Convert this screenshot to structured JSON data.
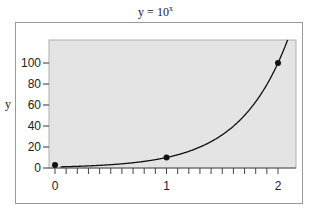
{
  "chart_data": {
    "type": "line",
    "title_base": "y = 10",
    "title_exp": "x",
    "xlabel": "",
    "ylabel": "y",
    "xlim": [
      0,
      2
    ],
    "ylim": [
      0,
      120
    ],
    "x_ticks": [
      0,
      1,
      2
    ],
    "x_tick_labels": [
      "0",
      "1",
      "2"
    ],
    "x_minor_tick_step": 0.1,
    "y_ticks": [
      0,
      20,
      40,
      60,
      80,
      100
    ],
    "y_tick_labels": [
      "0",
      "20",
      "40",
      "60",
      "80",
      "100"
    ],
    "grid": false,
    "plot_background": "#e4e4e4",
    "line_color": "#111111",
    "series": [
      {
        "name": "y = 10^x",
        "x": [
          0,
          0.2,
          0.4,
          0.6,
          0.8,
          1.0,
          1.2,
          1.4,
          1.6,
          1.8,
          2.0,
          2.08
        ],
        "values": [
          1,
          1.58,
          2.51,
          3.98,
          6.31,
          10,
          15.85,
          25.12,
          39.81,
          63.1,
          100,
          120.2
        ]
      }
    ],
    "points": [
      {
        "x": 0,
        "y": 1
      },
      {
        "x": 1,
        "y": 10
      },
      {
        "x": 2,
        "y": 100
      }
    ]
  }
}
